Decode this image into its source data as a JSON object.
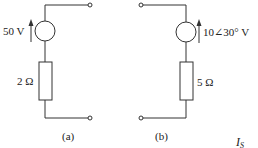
{
  "diagram": {
    "type": "circuit",
    "circuits": [
      {
        "id": "a",
        "caption": "(a)",
        "source": {
          "kind": "voltage-source",
          "label": "50 V",
          "direction": "up"
        },
        "resistor": {
          "label": "2 Ω"
        }
      },
      {
        "id": "b",
        "caption": "(b)",
        "source": {
          "kind": "voltage-source",
          "label": "10∠30° V",
          "direction": "up"
        },
        "resistor": {
          "label": "5 Ω"
        }
      }
    ],
    "extra_label": {
      "main": "I",
      "subscript": "S"
    },
    "colors": {
      "line": "#333333",
      "background": "#ffffff"
    }
  }
}
